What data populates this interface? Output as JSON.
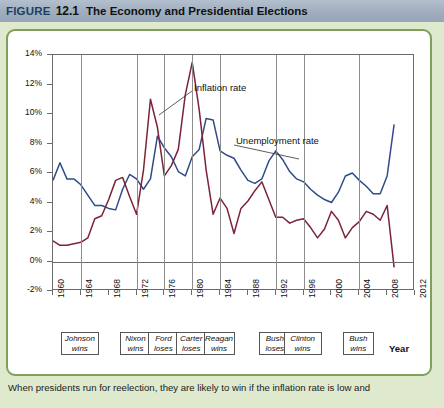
{
  "header": {
    "figure_word": "FIGURE",
    "figure_number": "12.1",
    "title": "The Economy and Presidential Elections"
  },
  "caption": "When presidents run for reelection, they are likely to win if the inflation rate is low and",
  "axis": {
    "x_title": "Year",
    "y_ticks": [
      "14%",
      "12%",
      "10%",
      "8%",
      "6%",
      "4%",
      "2%",
      "0%",
      "-2%"
    ],
    "x_ticks": [
      "1960",
      "1964",
      "1968",
      "1972",
      "1976",
      "1980",
      "1984",
      "1988",
      "1992",
      "1996",
      "2000",
      "2004",
      "2008",
      "2012"
    ]
  },
  "annotations": [
    {
      "name": "inflation-rate-label",
      "text": "Inflation rate"
    },
    {
      "name": "unemployment-rate-label",
      "text": "Unemployment rate"
    }
  ],
  "election_boxes": [
    {
      "name": "johnson-wins",
      "line1": "Johnson",
      "line2": "wins",
      "year": 1964
    },
    {
      "name": "nixon-wins",
      "line1": "Nixon",
      "line2": "wins",
      "year": 1972
    },
    {
      "name": "ford-loses",
      "line1": "Ford",
      "line2": "loses",
      "year": 1976
    },
    {
      "name": "carter-loses",
      "line1": "Carter",
      "line2": "loses",
      "year": 1980
    },
    {
      "name": "reagan-wins",
      "line1": "Reagan",
      "line2": "wins",
      "year": 1984
    },
    {
      "name": "bush-loses",
      "line1": "Bush",
      "line2": "loses",
      "year": 1992
    },
    {
      "name": "clinton-wins",
      "line1": "Clinton",
      "line2": "wins",
      "year": 1996
    },
    {
      "name": "bush-wins",
      "line1": "Bush",
      "line2": "wins",
      "year": 2004
    }
  ],
  "colors": {
    "inflation": "#7b2338",
    "unemployment": "#2f4b8c",
    "panel_border": "#7ea05a",
    "page_background": "#dfe9cd",
    "header_background": "#a2b0c1",
    "axis": "#6b6b6b",
    "gridline": "#8d8d8d"
  },
  "chart_data": {
    "type": "line",
    "title": "The Economy and Presidential Elections",
    "xlabel": "Year",
    "ylabel": "",
    "xlim": [
      1960,
      2012
    ],
    "ylim": [
      -2,
      14
    ],
    "ytick_step": 2,
    "xtick_step": 4,
    "grid": "vertical gridlines at presidential election years",
    "legend": "inline annotations with leader lines",
    "x": [
      1960,
      1961,
      1962,
      1963,
      1964,
      1965,
      1966,
      1967,
      1968,
      1969,
      1970,
      1971,
      1972,
      1973,
      1974,
      1975,
      1976,
      1977,
      1978,
      1979,
      1980,
      1981,
      1982,
      1983,
      1984,
      1985,
      1986,
      1987,
      1988,
      1989,
      1990,
      1991,
      1992,
      1993,
      1994,
      1995,
      1996,
      1997,
      1998,
      1999,
      2000,
      2001,
      2002,
      2003,
      2004,
      2005,
      2006,
      2007,
      2008,
      2009
    ],
    "series": [
      {
        "name": "Unemployment rate",
        "color": "#2f4b8c",
        "values": [
          5.5,
          6.7,
          5.6,
          5.6,
          5.2,
          4.5,
          3.8,
          3.8,
          3.6,
          3.5,
          4.9,
          5.9,
          5.6,
          4.9,
          5.6,
          8.5,
          7.7,
          7.1,
          6.1,
          5.8,
          7.1,
          7.6,
          9.7,
          9.6,
          7.5,
          7.2,
          7.0,
          6.2,
          5.5,
          5.3,
          5.6,
          6.8,
          7.5,
          6.9,
          6.1,
          5.6,
          5.4,
          4.9,
          4.5,
          4.2,
          4.0,
          4.7,
          5.8,
          6.0,
          5.5,
          5.1,
          4.6,
          4.6,
          5.8,
          9.3
        ]
      },
      {
        "name": "Inflation rate",
        "color": "#7b2338",
        "values": [
          1.4,
          1.1,
          1.1,
          1.2,
          1.3,
          1.6,
          2.9,
          3.1,
          4.2,
          5.5,
          5.7,
          4.4,
          3.2,
          6.2,
          11.0,
          9.1,
          5.8,
          6.5,
          7.6,
          11.3,
          13.5,
          10.3,
          6.2,
          3.2,
          4.3,
          3.6,
          1.9,
          3.6,
          4.1,
          4.8,
          5.4,
          4.2,
          3.0,
          3.0,
          2.6,
          2.8,
          2.9,
          2.3,
          1.6,
          2.2,
          3.4,
          2.8,
          1.6,
          2.3,
          2.7,
          3.4,
          3.2,
          2.8,
          3.8,
          -0.4
        ]
      }
    ]
  }
}
